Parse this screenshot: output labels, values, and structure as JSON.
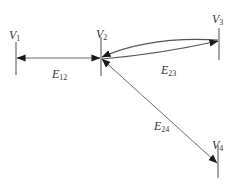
{
  "diagram": {
    "type": "graph",
    "colors": {
      "line": "#6a6a6a",
      "arrow": "#1a1a1a",
      "text": "#333333",
      "background": "#ffffff"
    },
    "vertices": [
      {
        "id": "V1",
        "main": "V",
        "sub": "1"
      },
      {
        "id": "V2",
        "main": "V",
        "sub": "2"
      },
      {
        "id": "V3",
        "main": "V",
        "sub": "3"
      },
      {
        "id": "V4",
        "main": "V",
        "sub": "4"
      }
    ],
    "edges": [
      {
        "id": "E12",
        "main": "E",
        "sub": "12",
        "from": "V1",
        "to": "V2",
        "style": "straight",
        "arrows": "both"
      },
      {
        "id": "E23",
        "main": "E",
        "sub": "23",
        "from": "V2",
        "to": "V3",
        "style": "double-curved",
        "arrows": "both"
      },
      {
        "id": "E24",
        "main": "E",
        "sub": "24",
        "from": "V2",
        "to": "V4",
        "style": "straight",
        "arrows": "both"
      }
    ]
  }
}
